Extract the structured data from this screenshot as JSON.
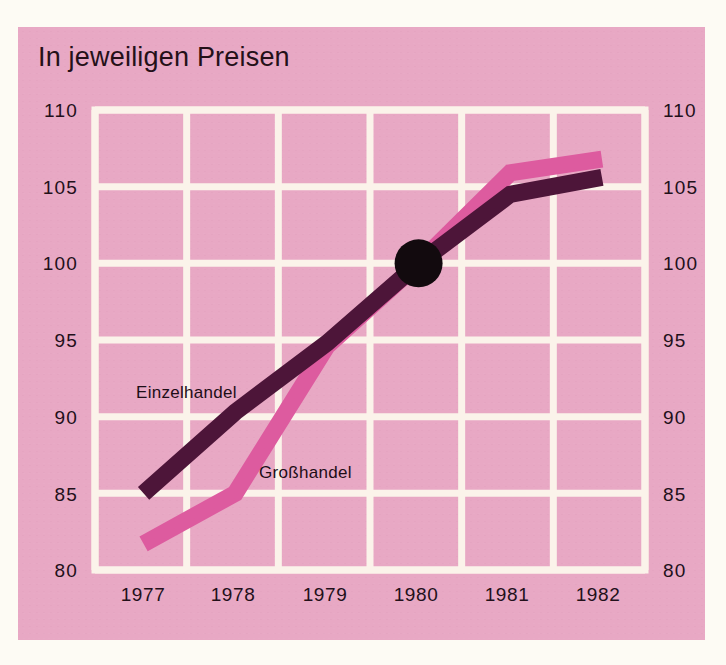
{
  "figure": {
    "title": "In jeweiligen Preisen",
    "background_color": "#fdfbf4",
    "panel_color": "#e8a8c4",
    "grid_color": "#fbf3ea"
  },
  "chart_data": {
    "type": "line",
    "title": "In jeweiligen Preisen",
    "xlabel": "",
    "ylabel": "",
    "categories": [
      "1977",
      "1978",
      "1979",
      "1980",
      "1981",
      "1982"
    ],
    "x": [
      1977,
      1978,
      1979,
      1980,
      1981,
      1982
    ],
    "xlim": [
      1976.5,
      1982.5
    ],
    "ylim": [
      80,
      110
    ],
    "yticks": [
      80,
      85,
      90,
      95,
      100,
      105,
      110
    ],
    "ytick_labels": [
      "80",
      "85",
      "90",
      "95",
      "100",
      "105",
      "110"
    ],
    "y_axis_both_sides": true,
    "grid": true,
    "legend": "inline-labels",
    "series": [
      {
        "name": "Einzelhandel",
        "color": "#4d1539",
        "values": [
          85.0,
          90.3,
          94.8,
          100.0,
          104.5,
          105.6
        ]
      },
      {
        "name": "Großhandel",
        "color": "#dd5b9f",
        "values": [
          81.7,
          85.0,
          94.6,
          100.0,
          105.9,
          106.8
        ]
      }
    ],
    "annotations": [
      {
        "name": "base-year-marker",
        "type": "point-marker",
        "shape": "circle",
        "color": "#120a0e",
        "x": 1980,
        "y": 100.0
      }
    ]
  },
  "axes": {
    "left_ticks": [
      "110",
      "105",
      "100",
      "95",
      "90",
      "85",
      "80"
    ],
    "right_ticks": [
      "110",
      "105",
      "100",
      "95",
      "90",
      "85",
      "80"
    ],
    "x_ticks": [
      "1977",
      "1978",
      "1979",
      "1980",
      "1981",
      "1982"
    ]
  },
  "series_labels": {
    "einzelhandel": "Einzelhandel",
    "grosshandel": "Großhandel"
  }
}
